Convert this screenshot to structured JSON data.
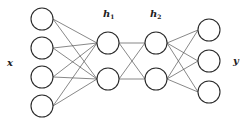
{
  "diagram": {
    "type": "feedforward-neural-network",
    "colors": {
      "node_stroke": "#2a2a2a",
      "node_fill": "#ffffff",
      "edge": "#555555",
      "label": "#222222"
    },
    "node_radius": 11,
    "layers": [
      {
        "name": "input",
        "label": "x",
        "label_sub": "",
        "label_pos": [
          7,
          58
        ],
        "x": 42,
        "ys": [
          19,
          48,
          77,
          106
        ]
      },
      {
        "name": "hidden-1",
        "label": "h",
        "label_sub": "1",
        "label_pos": [
          103,
          9
        ],
        "x": 108,
        "ys": [
          43,
          79
        ]
      },
      {
        "name": "hidden-2",
        "label": "h",
        "label_sub": "2",
        "label_pos": [
          150,
          9
        ],
        "x": 156,
        "ys": [
          43,
          79
        ]
      },
      {
        "name": "output",
        "label": "y",
        "label_sub": "",
        "label_pos": [
          233,
          56
        ],
        "x": 209,
        "ys": [
          30,
          61,
          92
        ]
      }
    ],
    "connectivity": "fully-connected between adjacent layers"
  }
}
